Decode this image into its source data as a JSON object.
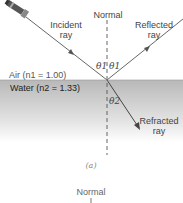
{
  "figure": {
    "panel_a": {
      "normal_label": "Normal",
      "incident_label_line1": "Incident",
      "incident_label_line2": "ray",
      "reflected_label_line1": "Reflected",
      "reflected_label_line2": "ray",
      "refracted_label_line1": "Refracted",
      "refracted_label_line2": "ray",
      "theta1_left": "θ1",
      "theta1_right": "θ1",
      "theta2": "θ2",
      "medium_top": "Air (n1 = 1.00)",
      "medium_bottom": "Water (n2 = 1.33)",
      "caption": "(a)"
    },
    "panel_b": {
      "normal_label": "Normal"
    },
    "icons": {
      "light_source": "flashlight-icon"
    },
    "colors": {
      "ray": "#555555",
      "water_top": "#b8b8b8",
      "normal_line": "#555555"
    }
  }
}
